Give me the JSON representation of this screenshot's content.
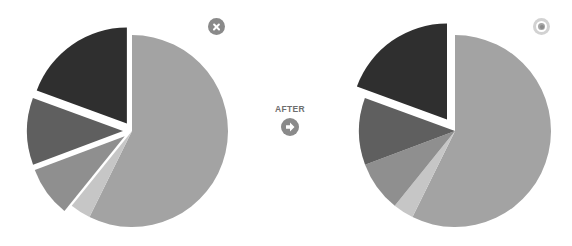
{
  "chart_data": [
    {
      "type": "pie",
      "title": "",
      "panel": "before",
      "start_angle_deg": 0,
      "direction": "clockwise",
      "slices": [
        {
          "id": "A",
          "value": 57.3,
          "color": "#a3a3a3",
          "explode": 0
        },
        {
          "id": "B",
          "value": 3.5,
          "color": "#c6c6c6",
          "explode": 0
        },
        {
          "id": "C",
          "value": 8.5,
          "color": "#8f8f8f",
          "explode": 9
        },
        {
          "id": "D",
          "value": 11.3,
          "color": "#5f5f5f",
          "explode": 9
        },
        {
          "id": "E",
          "value": 19.4,
          "color": "#2f2f2f",
          "explode": 9
        }
      ],
      "legend": null
    },
    {
      "type": "pie",
      "title": "",
      "panel": "after",
      "start_angle_deg": 0,
      "direction": "clockwise",
      "slices": [
        {
          "id": "A",
          "value": 57.3,
          "color": "#a3a3a3",
          "explode": 0
        },
        {
          "id": "B",
          "value": 3.5,
          "color": "#c6c6c6",
          "explode": 0
        },
        {
          "id": "C",
          "value": 8.5,
          "color": "#8f8f8f",
          "explode": 0
        },
        {
          "id": "D",
          "value": 11.3,
          "color": "#5f5f5f",
          "explode": 0
        },
        {
          "id": "E",
          "value": 19.4,
          "color": "#2f2f2f",
          "explode": 14
        }
      ],
      "legend": null
    }
  ],
  "pies": {
    "before": {
      "cx": 132,
      "cy": 131,
      "r": 96
    },
    "after": {
      "cx": 132,
      "cy": 131,
      "r": 96
    }
  },
  "labels": {
    "transition": "AFTER"
  },
  "icons": {
    "before_status": "close-icon",
    "after_status": "target-icon",
    "transition": "arrow-right-icon"
  },
  "colors": {
    "icon_gray": "#8a8a8a",
    "icon_light": "#d2d2d2",
    "label_gray": "#6e6e6e"
  }
}
